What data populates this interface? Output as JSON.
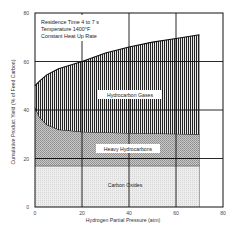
{
  "chart_data": {
    "type": "area",
    "title": "",
    "xlabel": "Hydrogen Partial Pressure (atm)",
    "ylabel": "Cumulative Product Yield (% of Feed Carbon)",
    "xlim": [
      0,
      80
    ],
    "ylim": [
      0,
      80
    ],
    "xticks": [
      "0",
      "20",
      "40",
      "60",
      "80"
    ],
    "yticks": [
      "0",
      "20",
      "40",
      "60",
      "80"
    ],
    "grid": true,
    "annotations": [
      "Residence Time 4 to 7 s",
      "Temperature 1400°F",
      "Constant Heat Up Rate"
    ],
    "series": [
      {
        "name": "Carbon Oxides",
        "x": [
          0,
          70
        ],
        "lower": [
          0,
          0
        ],
        "upper": [
          17,
          17
        ],
        "color": "#e6e6e6"
      },
      {
        "name": "Heavy Hydrocarbons",
        "x": [
          0,
          2,
          5,
          10,
          20,
          40,
          60,
          70
        ],
        "lower": [
          17,
          17,
          17,
          17,
          17,
          17,
          17,
          17
        ],
        "upper": [
          41,
          37,
          34,
          32,
          31,
          30.5,
          30.2,
          30
        ],
        "color": "#b5b5b5"
      },
      {
        "name": "Hydrocarbon Gases",
        "x": [
          0,
          2,
          5,
          10,
          20,
          30,
          40,
          50,
          60,
          70
        ],
        "lower": [
          41,
          37,
          34,
          32,
          31,
          30.7,
          30.5,
          30.3,
          30.2,
          30
        ],
        "upper": [
          50,
          52,
          54.5,
          57,
          60,
          63.5,
          66,
          68,
          69.5,
          71
        ],
        "color": "#3a3a3a"
      }
    ],
    "region_labels": [
      "Hydrocarbon Gases",
      "Heavy Hydrocarbons",
      "Carbon Oxides"
    ],
    "extra_lines": [
      {
        "name": "boundary-20",
        "y": 20
      }
    ]
  }
}
